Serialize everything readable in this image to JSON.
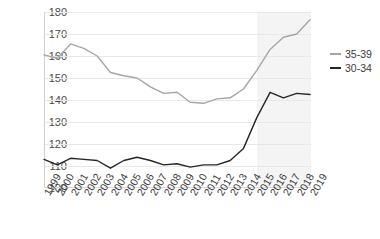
{
  "chart_data": {
    "type": "line",
    "title": "",
    "subtitle": "",
    "xlabel": "",
    "ylabel": "",
    "x": [
      1999,
      2000,
      2001,
      2002,
      2003,
      2004,
      2005,
      2006,
      2007,
      2008,
      2009,
      2010,
      2011,
      2012,
      2013,
      2014,
      2015,
      2016,
      2017,
      2018,
      2019
    ],
    "xtick_labels": [
      "1999",
      "2000",
      "2001",
      "2002",
      "2003",
      "2004",
      "2005",
      "2006",
      "2007",
      "2008",
      "2009",
      "2010",
      "2011",
      "2012",
      "2013",
      "2014",
      "2015",
      "2016",
      "2017",
      "2018",
      "2019"
    ],
    "ylim": [
      100,
      180
    ],
    "ytick_labels": [
      "100",
      "110",
      "120",
      "130",
      "140",
      "150",
      "160",
      "170",
      "180"
    ],
    "ytick_values": [
      100,
      110,
      120,
      130,
      140,
      150,
      160,
      170,
      180
    ],
    "grid": true,
    "legend_position": "right",
    "series": [
      {
        "name": "35-39",
        "color": "#a6a6a6",
        "values": [
          160.5,
          159.0,
          165.5,
          163.5,
          160.0,
          152.5,
          151.0,
          150.0,
          146.0,
          143.0,
          143.5,
          139.0,
          138.5,
          140.5,
          141.0,
          145.0,
          153.5,
          163.0,
          168.5,
          170.0,
          176.5
        ]
      },
      {
        "name": "30-34",
        "color": "#262626",
        "values": [
          113.0,
          110.5,
          113.5,
          113.0,
          112.5,
          109.0,
          112.5,
          114.0,
          112.5,
          110.5,
          111.0,
          109.5,
          110.5,
          110.5,
          112.5,
          118.0,
          132.0,
          143.5,
          141.0,
          143.0,
          142.5
        ]
      }
    ],
    "shaded_region": {
      "from": 2015,
      "to": 2019,
      "color": "#f4f4f4"
    }
  }
}
